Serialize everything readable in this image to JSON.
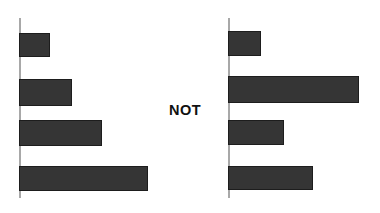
{
  "figure": {
    "background_color": "#ffffff",
    "bar_color": "#353535",
    "bar_edge_color": "#1d1d1d",
    "axis_color": "#a8a8a8",
    "text_color": "#111111",
    "annotation_label": "NOT"
  },
  "chart_data": [
    {
      "id": "left-chart",
      "type": "bar",
      "orientation": "horizontal",
      "title": "",
      "subtitle": "",
      "xlabel": "",
      "ylabel": "",
      "categories": [
        "",
        "",
        "",
        ""
      ],
      "tick_labels": [],
      "values": [
        31,
        53,
        83,
        129
      ],
      "xlim": [
        0,
        135
      ],
      "grid": false,
      "legend": null,
      "legend_position": "none",
      "axis": {
        "y_axis_visible": true,
        "x_axis_visible": false
      },
      "annotations": [],
      "bars": [
        {
          "index": 0,
          "value": 31,
          "top": 32.5,
          "height": 24.0
        },
        {
          "index": 1,
          "value": 53,
          "top": 79.0,
          "height": 27.0
        },
        {
          "index": 2,
          "value": 83,
          "top": 120.0,
          "height": 26.0
        },
        {
          "index": 3,
          "value": 129,
          "top": 165.5,
          "height": 25.5
        }
      ],
      "geometry": {
        "axis_x": 19,
        "axis_top": 18,
        "axis_bottom": 198
      }
    },
    {
      "id": "right-chart",
      "type": "bar",
      "orientation": "horizontal",
      "title": "",
      "subtitle": "",
      "xlabel": "",
      "ylabel": "",
      "categories": [
        "",
        "",
        "",
        ""
      ],
      "tick_labels": [],
      "values": [
        33,
        131,
        56,
        85
      ],
      "xlim": [
        0,
        135
      ],
      "grid": false,
      "legend": null,
      "legend_position": "none",
      "axis": {
        "y_axis_visible": true,
        "x_axis_visible": false
      },
      "annotations": [],
      "bars": [
        {
          "index": 0,
          "value": 33,
          "top": 30.5,
          "height": 25.0
        },
        {
          "index": 1,
          "value": 131,
          "top": 76.0,
          "height": 27.0
        },
        {
          "index": 2,
          "value": 56,
          "top": 120.0,
          "height": 25.0
        },
        {
          "index": 3,
          "value": 85,
          "top": 165.5,
          "height": 24.5
        }
      ],
      "geometry": {
        "axis_x": 18,
        "axis_top": 18,
        "axis_bottom": 198
      }
    }
  ]
}
